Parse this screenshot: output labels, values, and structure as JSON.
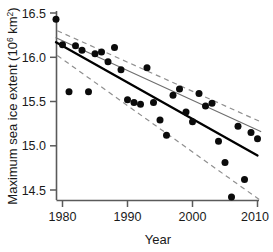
{
  "chart_data": {
    "type": "scatter",
    "title": "",
    "xlabel": "Year",
    "ylabel": "Maximum sea ice extent (10",
    "ylabel_superscript": "6",
    "ylabel_tail": " km",
    "ylabel_tail_superscript": "2",
    "ylabel_close": ")",
    "ylabel_full": "Maximum sea ice extent (10^6 km^2)",
    "xlim": [
      1978.5,
      2010.8
    ],
    "ylim": [
      14.32,
      16.62
    ],
    "grid": false,
    "legend": "none",
    "xticks": [
      1980,
      1990,
      2000,
      2010
    ],
    "xtick_labels": [
      "1980",
      "1990",
      "2000",
      "2010"
    ],
    "yticks": [
      14.5,
      15.0,
      15.5,
      16.0,
      16.5
    ],
    "ytick_labels": [
      "14.5",
      "15.0",
      "15.5",
      "16.0",
      "16.5"
    ],
    "x": [
      1979,
      1980,
      1981,
      1982,
      1983,
      1984,
      1985,
      1986,
      1987,
      1988,
      1989,
      1990,
      1991,
      1992,
      1993,
      1994,
      1995,
      1996,
      1997,
      1998,
      1999,
      2000,
      2001,
      2002,
      2003,
      2004,
      2005,
      2006,
      2007,
      2008,
      2009,
      2010
    ],
    "y": [
      16.43,
      16.14,
      15.61,
      16.13,
      16.08,
      15.61,
      16.04,
      16.06,
      15.95,
      16.11,
      15.86,
      15.52,
      15.49,
      15.47,
      15.88,
      15.49,
      15.29,
      15.12,
      15.57,
      15.64,
      15.38,
      15.27,
      15.59,
      15.45,
      15.48,
      15.05,
      14.81,
      14.42,
      15.22,
      14.62,
      15.15,
      15.08
    ],
    "series": [
      {
        "name": "data points",
        "role": "scatter",
        "marker": "filled-circle",
        "color": "#0b0b0b",
        "values": [
          16.43,
          16.14,
          15.61,
          16.13,
          16.08,
          15.61,
          16.04,
          16.06,
          15.95,
          16.11,
          15.86,
          15.52,
          15.49,
          15.47,
          15.88,
          15.49,
          15.29,
          15.12,
          15.57,
          15.64,
          15.38,
          15.27,
          15.59,
          15.45,
          15.48,
          15.05,
          14.81,
          14.42,
          15.22,
          14.62,
          15.15,
          15.08
        ]
      },
      {
        "name": "regression fit (thick)",
        "role": "trend-line",
        "style": "solid",
        "color": "#000000",
        "endpoints": [
          [
            1979.0,
            16.17
          ],
          [
            2010.0,
            14.89
          ]
        ]
      },
      {
        "name": "regression fit (thin)",
        "role": "trend-line",
        "style": "solid-thin",
        "color": "#6e6e6e",
        "endpoints": [
          [
            1979.0,
            16.22
          ],
          [
            2010.5,
            15.16
          ]
        ]
      },
      {
        "name": "upper confidence band",
        "role": "confidence-interval",
        "style": "dashed",
        "color": "#8f8f8f",
        "endpoints": [
          [
            1979.2,
            16.3
          ],
          [
            2010.5,
            15.27
          ]
        ]
      },
      {
        "name": "lower confidence band",
        "role": "confidence-interval",
        "style": "dashed",
        "color": "#8f8f8f",
        "endpoints": [
          [
            1979.2,
            16.02
          ],
          [
            2010.5,
            14.38
          ]
        ]
      }
    ],
    "annotations": []
  }
}
